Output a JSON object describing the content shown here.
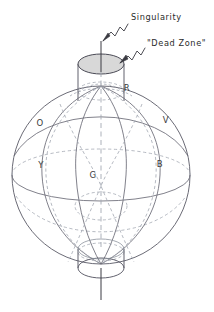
{
  "figure": {
    "type": "diagram",
    "background_color": "#ffffff",
    "line_color": "#5a5a66",
    "dashed_color": "#9aa0ab",
    "shade_color": "#d6d6d6",
    "text_color": "#2b2b2b"
  },
  "annotations": [
    {
      "id": "singularity",
      "label": "Singularity",
      "label_x": 131,
      "label_y": 17,
      "arrow_tip_x": 103,
      "arrow_tip_y": 41
    },
    {
      "id": "dead-zone",
      "label": "\"Dead Zone\"",
      "label_x": 144,
      "label_y": 47,
      "arrow_tip_x": 120,
      "arrow_tip_y": 63
    }
  ],
  "region_labels": [
    {
      "id": "region-o",
      "text": "O",
      "x": 40,
      "y": 123
    },
    {
      "id": "region-r",
      "text": "R",
      "x": 127,
      "y": 88
    },
    {
      "id": "region-v",
      "text": "V",
      "x": 166,
      "y": 120
    },
    {
      "id": "region-y",
      "text": "Y",
      "x": 41,
      "y": 165
    },
    {
      "id": "region-g",
      "text": "G",
      "x": 93,
      "y": 175
    },
    {
      "id": "region-b",
      "text": "B",
      "x": 160,
      "y": 164
    }
  ],
  "geometry": {
    "sphere": {
      "cx": 101,
      "cy": 175,
      "r": 89
    },
    "cylinder": {
      "left_x": 78,
      "right_x": 124,
      "radius_x": 23,
      "radius_y": 10
    },
    "top_cap": {
      "cx": 101,
      "cy": 64,
      "rx": 23,
      "ry": 10
    },
    "top_body": {
      "y_top": 64,
      "y_bottom": 100
    },
    "bottom_cap": {
      "cx": 101,
      "cy": 268,
      "rx": 23,
      "ry": 10
    },
    "bottom_body": {
      "y_top": 250,
      "y_bottom": 268
    },
    "axis": {
      "x": 101,
      "y_top": 41,
      "y_bottom": 300
    },
    "equator": {
      "cx": 101,
      "cy": 175,
      "rx": 89,
      "ry": 26
    },
    "horizon_arc": {
      "cx": 101,
      "cy": 130,
      "rx": 89,
      "ry": 36
    }
  }
}
